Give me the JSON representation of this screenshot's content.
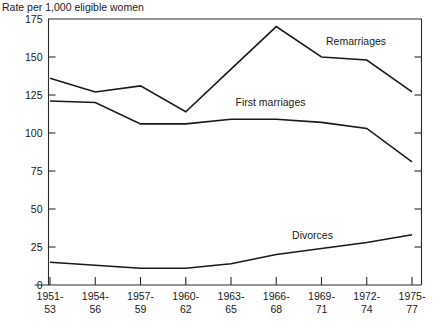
{
  "chart_data": {
    "type": "line",
    "title": "",
    "ylabel": "Rate per 1,000 eligible women",
    "xlabel": "",
    "ylim": [
      0,
      175
    ],
    "ytick_labels": [
      "175",
      "150",
      "125",
      "100",
      "75",
      "50",
      "25",
      "0"
    ],
    "ytick_values": [
      175,
      150,
      125,
      100,
      75,
      50,
      25,
      0
    ],
    "grid": false,
    "legend_position": "inline-annotations",
    "categories": [
      "1951-\n53",
      "1954-\n56",
      "1957-\n59",
      "1960-\n62",
      "1963-\n65",
      "1966-\n68",
      "1969-\n71",
      "1972-\n74",
      "1975-\n77"
    ],
    "xtick_labels_top": [
      "1951-",
      "1954-",
      "1957-",
      "1960-",
      "1963-",
      "1966-",
      "1969-",
      "1972-",
      "1975-"
    ],
    "xtick_labels_bottom": [
      "53",
      "56",
      "59",
      "62",
      "65",
      "68",
      "71",
      "74",
      "77"
    ],
    "series": [
      {
        "name": "Remarriages",
        "values": [
          136,
          127,
          131,
          114,
          142,
          170,
          150,
          148,
          127
        ]
      },
      {
        "name": "First marriages",
        "values": [
          121,
          120,
          106,
          106,
          109,
          109,
          107,
          103,
          81
        ]
      },
      {
        "name": "Divorces",
        "values": [
          15,
          13,
          11,
          11,
          14,
          20,
          24,
          28,
          33
        ]
      }
    ],
    "annotations": [
      {
        "text": "Remarriages",
        "x_index": 6.1,
        "value": 158
      },
      {
        "text": "First marriages",
        "x_index": 4.1,
        "value": 118
      },
      {
        "text": "Divorces",
        "x_index": 5.35,
        "value": 30
      }
    ]
  }
}
